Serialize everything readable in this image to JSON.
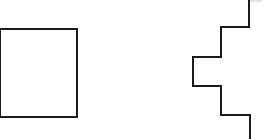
{
  "canvas": {
    "width": 265,
    "height": 139,
    "background": "#ffffff"
  },
  "stroke": {
    "color": "#1a1a1a",
    "width": 2
  },
  "shapes": {
    "rectangle": {
      "x": 0,
      "y": 29,
      "width": 77,
      "height": 88
    },
    "stepped_path": {
      "points": "249,0 249,27 221,27 221,57 193,57 193,86 221,86 221,115 250,115 250,139"
    },
    "top_tick": {
      "x1": 250,
      "y1": 1,
      "x2": 262,
      "y2": 1,
      "color": "#cccccc"
    }
  }
}
